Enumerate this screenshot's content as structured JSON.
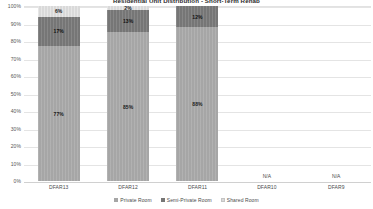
{
  "chart_data": {
    "type": "bar",
    "stacked": true,
    "normalized_to_percent": true,
    "title": "Residential Unit Distribution - Short-Term Rehab",
    "xlabel": "",
    "ylabel": "",
    "ylim": [
      0,
      100
    ],
    "ytick_labels": [
      "100%",
      "90%",
      "80%",
      "70%",
      "60%",
      "50%",
      "40%",
      "30%",
      "20%",
      "10%",
      "0%"
    ],
    "ytick_values": [
      100,
      90,
      80,
      70,
      60,
      50,
      40,
      30,
      20,
      10,
      0
    ],
    "grid": true,
    "legend_position": "bottom",
    "categories": [
      "DFAR13",
      "DFAR12",
      "DFAR11",
      "DFAR10",
      "DFAR9"
    ],
    "series": [
      {
        "name": "Private Room",
        "color": "#a6a6a6",
        "values": [
          77,
          85,
          88,
          null,
          null
        ],
        "labels": [
          "77%",
          "85%",
          "88%",
          "",
          ""
        ]
      },
      {
        "name": "Semi-Private Room",
        "color": "#767676",
        "values": [
          17,
          13,
          12,
          null,
          null
        ],
        "labels": [
          "17%",
          "13%",
          "12%",
          "",
          ""
        ]
      },
      {
        "name": "Shared Room",
        "color": "#d9d9d9",
        "values": [
          6,
          2,
          0,
          null,
          null
        ],
        "labels": [
          "6%",
          "2%",
          "",
          "",
          ""
        ]
      }
    ],
    "annotations": [
      {
        "category": "DFAR10",
        "text": "N/A"
      },
      {
        "category": "DFAR9",
        "text": "N/A"
      }
    ]
  },
  "legend": {
    "items": [
      {
        "label": "Private Room"
      },
      {
        "label": "Semi-Private Room"
      },
      {
        "label": "Shared Room"
      }
    ]
  }
}
